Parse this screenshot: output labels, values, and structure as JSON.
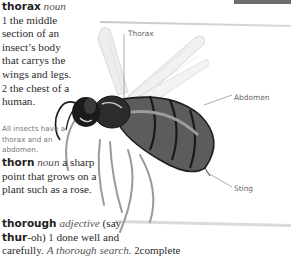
{
  "entries": {
    "thorax": {
      "headword": "thorax",
      "pos": "noun",
      "sense1_num": "1",
      "sense1": "the middle section of an insect’s body that carrys the wings and legs.",
      "sense2_num": "2",
      "sense2": "the chest of a human."
    },
    "thorn": {
      "headword": "thorn",
      "pos": "noun",
      "definition": "a sharp point that grows on  a plant such as a rose."
    },
    "thorough": {
      "headword": "thorough",
      "pos": "adjective",
      "pron_open": "(say",
      "pron_stress": "thur",
      "pron_rest": "-oh)",
      "sense1_num": "1",
      "sense1": "done well and",
      "line3": "carefully.",
      "example": "A thorough search.",
      "sense2_num": "2",
      "sense2": "complete"
    }
  },
  "note": "All insects have a thorax and an abdomen.",
  "illustration": {
    "subject": "wasp",
    "labels": {
      "thorax": "Thorax",
      "abdomen": "Abdomen",
      "sting": "Sting"
    }
  }
}
